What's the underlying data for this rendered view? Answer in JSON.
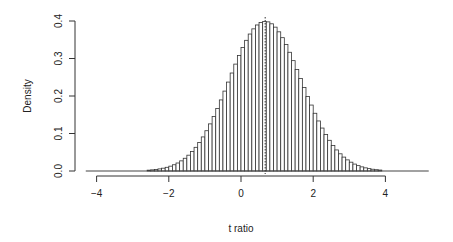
{
  "chart_data": {
    "type": "bar",
    "subtype": "histogram",
    "title": "",
    "xlabel": "t ratio",
    "ylabel": "Density",
    "xlim": [
      -4.3,
      5.2
    ],
    "ylim": [
      0,
      0.4
    ],
    "xticks": [
      -4,
      -2,
      0,
      2,
      4
    ],
    "xtick_labels": [
      "−4",
      "−2",
      "0",
      "2",
      "4"
    ],
    "yticks": [
      0.0,
      0.1,
      0.2,
      0.3,
      0.4
    ],
    "ytick_labels": [
      "0.0",
      "0.1",
      "0.2",
      "0.3",
      "0.4"
    ],
    "grid": false,
    "legend": null,
    "bin_width": 0.1,
    "distribution_approx": {
      "shape": "normal",
      "mean": 0.67,
      "sd": 1.0,
      "peak_density": 0.4
    },
    "reference_line": {
      "x": 0.67,
      "style": "dotted",
      "label": ""
    },
    "baseline_range": [
      -4.3,
      5.2
    ],
    "bar_fill": "#ffffff",
    "bar_stroke": "#333333"
  }
}
